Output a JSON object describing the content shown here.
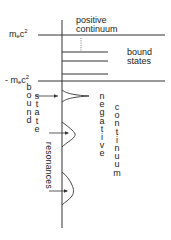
{
  "diagram": {
    "labels": {
      "positive_continuum_line1": "positive",
      "positive_continuum_line2": "continuum",
      "upper_energy": {
        "prefix": "m",
        "subscript": "e",
        "base": "c",
        "superscript": "2"
      },
      "lower_energy": {
        "prefix": "- m",
        "subscript": "e",
        "base": "c",
        "superscript": "2"
      },
      "bound_states_line1": "bound",
      "bound_states_line2": "states",
      "bound_vertical": "bound",
      "state_vertical": "state",
      "resonances": "resonances",
      "negative": "negative",
      "continuum": "continuum"
    },
    "colors": {
      "line": "#333333",
      "text": "#222222",
      "background": "#ffffff"
    }
  }
}
